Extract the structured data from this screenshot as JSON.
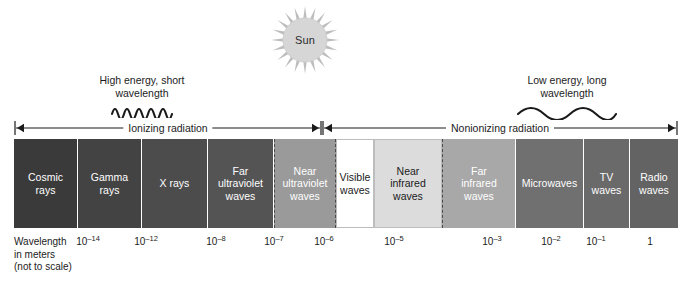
{
  "sun": {
    "label": "Sun",
    "icon": "sun-icon",
    "color": "#c9c9c9"
  },
  "annotations": {
    "high": {
      "text": "High energy, short\nwavelength",
      "wave": "short-wavelength-squiggle"
    },
    "low": {
      "text": "Low energy, long\nwavelength",
      "wave": "long-wavelength-squiggle"
    }
  },
  "arrows": {
    "ionizing": {
      "label": "Ionizing radiation",
      "start_px": 14,
      "end_px": 322
    },
    "nonionizing": {
      "label": "Nonionizing radiation",
      "start_px": 322,
      "end_px": 678
    }
  },
  "spectrum": {
    "bands": [
      {
        "name": "cosmic-rays",
        "label": "Cosmic\nrays",
        "color": "#3a3a3a",
        "text_color": "#ffffff",
        "width": 64
      },
      {
        "name": "gamma-rays",
        "label": "Gamma\nrays",
        "color": "#434343",
        "text_color": "#ffffff",
        "width": 64
      },
      {
        "name": "x-rays",
        "label": "X rays",
        "color": "#4c4c4c",
        "text_color": "#ffffff",
        "width": 66
      },
      {
        "name": "far-ultraviolet",
        "label": "Far\nultraviolet\nwaves",
        "color": "#545454",
        "text_color": "#ffffff",
        "width": 66
      },
      {
        "name": "near-ultraviolet",
        "label": "Near\nultraviolet\nwaves",
        "color": "#9a9a9a",
        "text_color": "#ffffff",
        "width": 62
      },
      {
        "name": "visible-waves",
        "label": "Visible\nwaves",
        "color": "#ffffff",
        "text_color": "#1a1a1a",
        "width": 38
      },
      {
        "name": "near-infrared",
        "label": "Near\ninfrared\nwaves",
        "color": "#dcdcdc",
        "text_color": "#1a1a1a",
        "width": 68
      },
      {
        "name": "far-infrared",
        "label": "Far\ninfrared\nwaves",
        "color": "#a8a8a8",
        "text_color": "#ffffff",
        "width": 74
      },
      {
        "name": "microwaves",
        "label": "Microwaves",
        "color": "#707070",
        "text_color": "#ffffff",
        "width": 68
      },
      {
        "name": "tv-waves",
        "label": "TV\nwaves",
        "color": "#6a6a6a",
        "text_color": "#ffffff",
        "width": 46
      },
      {
        "name": "radio-waves",
        "label": "Radio\nwaves",
        "color": "#636363",
        "text_color": "#ffffff",
        "width": 48
      }
    ]
  },
  "scale": {
    "caption": "Wavelength\nin meters\n(not to scale)",
    "ticks": [
      {
        "base": "10",
        "exp": "–14",
        "x": 88
      },
      {
        "base": "10",
        "exp": "–12",
        "x": 146
      },
      {
        "base": "10",
        "exp": "–8",
        "x": 216
      },
      {
        "base": "10",
        "exp": "–7",
        "x": 274
      },
      {
        "base": "10",
        "exp": "–6",
        "x": 324
      },
      {
        "base": "10",
        "exp": "–5",
        "x": 394
      },
      {
        "base": "10",
        "exp": "–3",
        "x": 492
      },
      {
        "base": "10",
        "exp": "–2",
        "x": 551
      },
      {
        "base": "10",
        "exp": "–1",
        "x": 596
      },
      {
        "base": "1",
        "exp": "",
        "x": 650
      }
    ]
  }
}
